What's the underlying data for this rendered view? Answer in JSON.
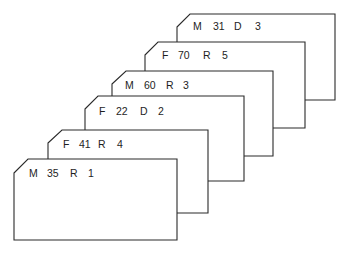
{
  "diagram": {
    "cards": [
      {
        "sex": "M",
        "age": "31",
        "status": "D",
        "count": "3",
        "x": 177,
        "y": 14,
        "w": 158,
        "h": 86
      },
      {
        "sex": "F",
        "age": "70",
        "status": "R",
        "count": "5",
        "x": 145,
        "y": 42,
        "w": 160,
        "h": 86
      },
      {
        "sex": "M",
        "age": "60",
        "status": "R",
        "count": "3",
        "x": 112,
        "y": 71,
        "w": 161,
        "h": 85
      },
      {
        "sex": "F",
        "age": "22",
        "status": "D",
        "count": "2",
        "x": 85,
        "y": 96,
        "w": 159,
        "h": 85
      },
      {
        "sex": "F",
        "age": "41",
        "status": "R",
        "count": "4",
        "x": 48,
        "y": 130,
        "w": 160,
        "h": 83
      },
      {
        "sex": "M",
        "age": "35",
        "status": "R",
        "count": "1",
        "x": 14,
        "y": 159,
        "w": 163,
        "h": 81
      }
    ]
  },
  "colors": {
    "stroke": "#2a2a2a",
    "card_fill": "#ffffff",
    "text": "#1e1e1e",
    "background": "#ffffff"
  }
}
